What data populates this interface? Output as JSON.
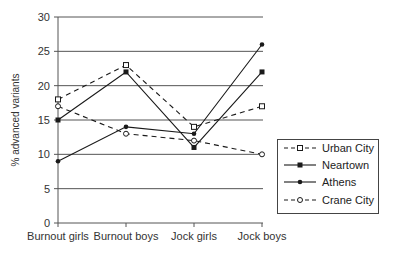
{
  "chart_data": {
    "type": "line",
    "title": "",
    "xlabel": "",
    "ylabel": "% advanced variants",
    "ylim": [
      0,
      30
    ],
    "yticks": [
      0,
      5,
      10,
      15,
      20,
      25,
      30
    ],
    "grid": "horizontal",
    "legend_position": "right",
    "categories": [
      "Burnout girls",
      "Burnout boys",
      "Jock girls",
      "Jock boys"
    ],
    "series": [
      {
        "name": "Urban City",
        "style": "dashed",
        "marker": "open-square",
        "values": [
          18,
          23,
          14,
          17
        ]
      },
      {
        "name": "Neartown",
        "style": "solid",
        "marker": "filled-square",
        "values": [
          15,
          22,
          11,
          22
        ]
      },
      {
        "name": "Athens",
        "style": "solid",
        "marker": "filled-dot",
        "values": [
          9,
          14,
          13,
          26
        ]
      },
      {
        "name": "Crane City",
        "style": "dashed",
        "marker": "open-circle",
        "values": [
          17,
          13,
          12,
          10
        ]
      }
    ]
  },
  "colors": {
    "line": "#1a1a1a",
    "grid": "#555555",
    "background": "#ffffff"
  }
}
